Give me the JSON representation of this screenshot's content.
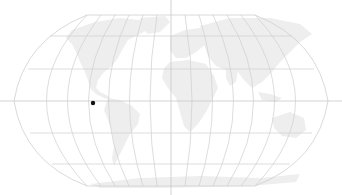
{
  "map": {
    "projection": "Robinson",
    "colors": {
      "background": "#ffffff",
      "land": "#eeeeee",
      "graticule": "#cfcfcf",
      "outline": "#cfcfcf",
      "crosshair": "#c8c8c8",
      "marker": "#111111"
    },
    "marker": {
      "x": 93,
      "y": 103,
      "label": ""
    },
    "crosshair": {
      "x": 171,
      "y": 101
    }
  }
}
